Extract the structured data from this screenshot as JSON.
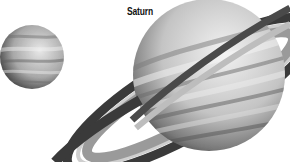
{
  "title": "Saturn",
  "objects": [
    {
      "name": "small-planet",
      "shape": "banded sphere",
      "color": "#9a9a9a"
    },
    {
      "name": "saturn-planet",
      "shape": "banded sphere with tilted rings",
      "color": "#b5b5b5"
    }
  ],
  "colors": {
    "background": "#ffffff",
    "planet_light": "#e6e6e6",
    "planet_dark": "#4a4a4a",
    "ring_dark": "#3a3a3a",
    "ring_mid": "#8a8a8a",
    "ring_light": "#cfcfcf"
  }
}
